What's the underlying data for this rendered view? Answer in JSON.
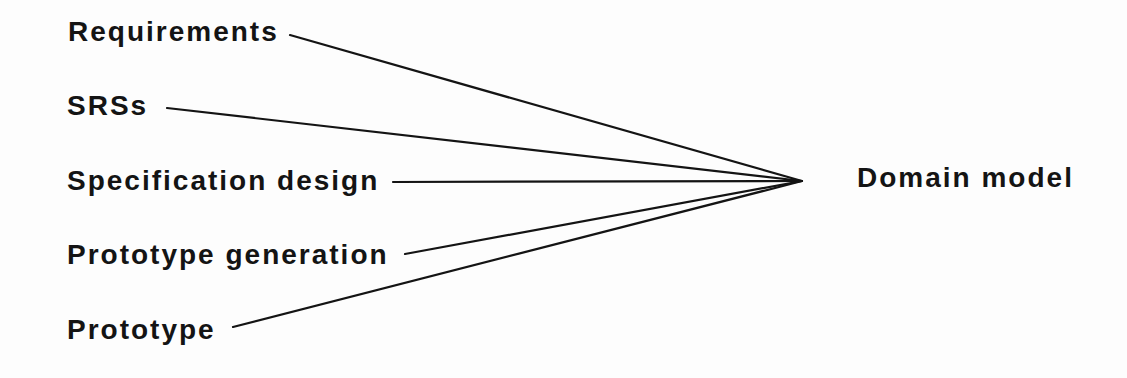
{
  "diagram": {
    "sources": [
      {
        "id": "requirements",
        "label": "Requirements",
        "x": 68,
        "top": 17,
        "line_from": [
          290,
          35
        ]
      },
      {
        "id": "srss",
        "label": "SRSs",
        "x": 67,
        "top": 91,
        "line_from": [
          167,
          108
        ]
      },
      {
        "id": "specification-design",
        "label": "Specification design",
        "x": 67,
        "top": 166,
        "line_from": [
          393,
          182
        ]
      },
      {
        "id": "prototype-generation",
        "label": "Prototype generation",
        "x": 67,
        "top": 240,
        "line_from": [
          405,
          254
        ]
      },
      {
        "id": "prototype",
        "label": "Prototype",
        "x": 67,
        "top": 315,
        "line_from": [
          233,
          327
        ]
      }
    ],
    "target": {
      "id": "domain-model",
      "label": "Domain model",
      "x": 857,
      "top": 163
    },
    "apex": [
      802,
      181
    ],
    "colors": {
      "line": "#141414",
      "text": "#141414",
      "background": "#fdfdfd"
    }
  }
}
